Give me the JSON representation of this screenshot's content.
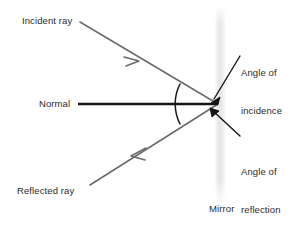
{
  "diagram": {
    "colors": {
      "ray_stroke": "#6b6b6b",
      "normal_stroke": "#1a1a1a",
      "pointer_stroke": "#1a1a1a",
      "arc_stroke": "#1a1a1a",
      "mirror_fill": "#e3e3e3",
      "text": "#2b2b2b",
      "background": "#ffffff"
    },
    "labels": {
      "incident_ray": "Incident ray",
      "normal": "Normal",
      "reflected_ray": "Reflected ray",
      "angle_of_incidence_line1": "Angle of",
      "angle_of_incidence_line2": "incidence",
      "angle_of_reflection_line1": "Angle of",
      "angle_of_reflection_line2": "reflection",
      "mirror": "Mirror"
    },
    "geometry": {
      "incidence_point": {
        "x": 218,
        "y": 104
      },
      "mirror_band": {
        "x": 215,
        "y_top": 8,
        "y_bottom": 201,
        "width": 10
      },
      "normal_line": {
        "x1": 78,
        "y1": 104,
        "x2": 218,
        "y2": 104
      },
      "incident_ray": {
        "x1": 80,
        "y1": 22,
        "x2": 218,
        "y2": 104
      },
      "reflected_ray": {
        "x1": 218,
        "y1": 104,
        "x2": 90,
        "y2": 185
      },
      "incident_arrow_at": {
        "x": 137,
        "y": 60
      },
      "reflected_arrow_at": {
        "x": 133,
        "y": 155
      },
      "angle_arc": {
        "radius": 44,
        "from_deg": 210,
        "to_deg": 150
      },
      "incidence_pointer": {
        "x1": 241,
        "y1": 57,
        "x2": 213,
        "y2": 99
      },
      "reflection_pointer": {
        "x1": 241,
        "y1": 135,
        "x2": 212,
        "y2": 110
      }
    }
  }
}
